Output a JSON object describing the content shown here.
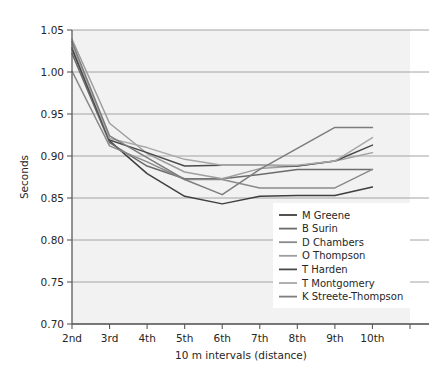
{
  "chart_data": {
    "type": "line",
    "title": "",
    "xlabel": "10 m intervals (distance)",
    "ylabel": "Seconds",
    "categories": [
      "2nd",
      "3rd",
      "4th",
      "5th",
      "6th",
      "7th",
      "8th",
      "9th",
      "10th"
    ],
    "ytick_labels": [
      "0.70",
      "0.75",
      "0.80",
      "0.85",
      "0.90",
      "0.95",
      "1.00",
      "1.05"
    ],
    "ytick_values": [
      0.7,
      0.75,
      0.8,
      0.85,
      0.9,
      0.95,
      1.0,
      1.05
    ],
    "ylim": [
      0.7,
      1.05
    ],
    "grid": true,
    "legend_position": "lower right",
    "series": [
      {
        "name": "M Greene",
        "color": "#3f3f3f",
        "values": [
          1.029,
          0.918,
          0.879,
          0.852,
          0.843,
          0.852,
          0.853,
          0.853,
          0.863
        ]
      },
      {
        "name": "B Surin",
        "color": "#6b6b6b",
        "values": [
          1.022,
          0.916,
          0.888,
          0.873,
          0.873,
          0.878,
          0.884,
          0.884,
          0.884
        ]
      },
      {
        "name": "D Chambers",
        "color": "#8a8a8a",
        "values": [
          1.001,
          0.912,
          0.893,
          0.872,
          0.872,
          0.862,
          0.862,
          0.862,
          0.884
        ]
      },
      {
        "name": "O Thompson",
        "color": "#9e9e9e",
        "values": [
          1.039,
          0.939,
          0.903,
          0.881,
          0.873,
          0.885,
          0.888,
          0.894,
          0.904
        ]
      },
      {
        "name": "T Harden",
        "color": "#4a4a4a",
        "values": [
          1.027,
          0.919,
          0.904,
          0.888,
          0.889,
          0.889,
          0.888,
          0.894,
          0.913
        ]
      },
      {
        "name": "T Montgomery",
        "color": "#a8a8a8",
        "values": [
          1.033,
          0.921,
          0.91,
          0.896,
          0.889,
          0.889,
          0.889,
          0.894,
          0.922
        ]
      },
      {
        "name": "K Streete-Thompson",
        "color": "#7d7d7d",
        "values": [
          1.036,
          0.924,
          0.898,
          0.872,
          0.854,
          0.884,
          0.909,
          0.934,
          0.934
        ]
      }
    ]
  },
  "legend": {
    "items": [
      {
        "label": "M Greene"
      },
      {
        "label": "B Surin"
      },
      {
        "label": "D Chambers"
      },
      {
        "label": "O Thompson"
      },
      {
        "label": "T Harden"
      },
      {
        "label": "T Montgomery"
      },
      {
        "label": "K Streete-Thompson"
      }
    ]
  },
  "colors": {
    "plot_background": "#f2f2f2",
    "gridline": "#9a9a9a",
    "axis": "#5a5a5a",
    "text": "#262626",
    "page_background": "#ffffff"
  }
}
